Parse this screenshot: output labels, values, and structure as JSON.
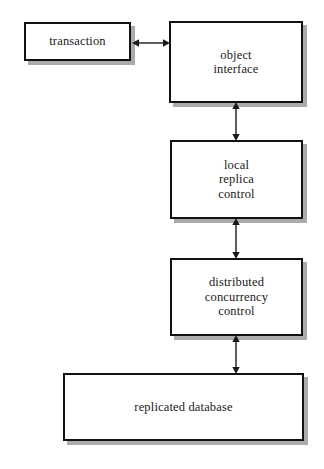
{
  "diagram": {
    "canvas": {
      "width": 324,
      "height": 469,
      "background": "#ffffff"
    },
    "style": {
      "box_fill": "#ffffff",
      "box_border": "#111111",
      "shadow": "#969696",
      "text_color": "#1a1a1a",
      "arrow_color": "#1a1a1a"
    },
    "nodes": [
      {
        "id": "transaction",
        "label": "transaction"
      },
      {
        "id": "object-interface",
        "label": "object\ninterface"
      },
      {
        "id": "local-replica-control",
        "label": "local\nreplica\ncontrol"
      },
      {
        "id": "distributed-concurrency-control",
        "label": "distributed\nconcurrency\ncontrol"
      },
      {
        "id": "replicated-database",
        "label": "replicated database"
      }
    ],
    "edges": [
      {
        "id": "transaction-object",
        "from": "transaction",
        "to": "object-interface",
        "direction": "bidirectional",
        "orientation": "horizontal"
      },
      {
        "id": "object-local",
        "from": "object-interface",
        "to": "local-replica-control",
        "direction": "bidirectional",
        "orientation": "vertical"
      },
      {
        "id": "local-distributed",
        "from": "local-replica-control",
        "to": "distributed-concurrency-control",
        "direction": "bidirectional",
        "orientation": "vertical"
      },
      {
        "id": "distributed-database",
        "from": "distributed-concurrency-control",
        "to": "replicated-database",
        "direction": "bidirectional",
        "orientation": "vertical"
      }
    ]
  }
}
